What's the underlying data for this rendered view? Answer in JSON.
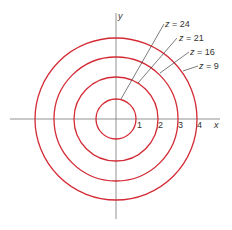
{
  "diagram": {
    "axes": {
      "x_label": "x",
      "y_label": "y"
    },
    "ticks": [
      "1",
      "2",
      "3",
      "4"
    ],
    "curve_color": "#d42a35",
    "axis_color": "#666666",
    "levels": [
      {
        "label": "z = 24",
        "radius": 1
      },
      {
        "label": "z = 21",
        "radius": 2
      },
      {
        "label": "z = 16",
        "radius": 3
      },
      {
        "label": "z = 9",
        "radius": 4
      }
    ]
  }
}
